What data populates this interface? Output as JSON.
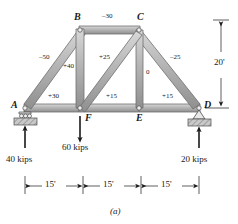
{
  "figure": {
    "caption": "(a)",
    "joints": [
      {
        "id": "A",
        "label": "A"
      },
      {
        "id": "B",
        "label": "B"
      },
      {
        "id": "C",
        "label": "C"
      },
      {
        "id": "D",
        "label": "D"
      },
      {
        "id": "E",
        "label": "E"
      },
      {
        "id": "F",
        "label": "F"
      }
    ],
    "member_forces": [
      {
        "member": "BC",
        "label": "–30"
      },
      {
        "member": "AB",
        "label": "–50"
      },
      {
        "member": "CD",
        "label": "–25"
      },
      {
        "member": "BF",
        "label": "+40"
      },
      {
        "member": "FC",
        "label": "+25"
      },
      {
        "member": "CE",
        "label": "0"
      },
      {
        "member": "AF",
        "label": "+30"
      },
      {
        "member": "FE",
        "label": "+15"
      },
      {
        "member": "ED",
        "label": "+15"
      }
    ],
    "loads": [
      {
        "at": "A",
        "label": "40 kips",
        "direction": "up"
      },
      {
        "at": "F",
        "label": "60 kips",
        "direction": "down"
      },
      {
        "at": "D",
        "label": "20 kips",
        "direction": "up"
      }
    ],
    "dimensions": {
      "horizontal": [
        {
          "label": "15'"
        },
        {
          "label": "15'"
        },
        {
          "label": "15'"
        }
      ],
      "vertical": {
        "label": "20'"
      }
    },
    "supports": [
      {
        "at": "A",
        "type": "roller-support"
      },
      {
        "at": "D",
        "type": "pin-support"
      }
    ],
    "colors": {
      "member_fill": "#b3b3b3",
      "member_edge": "#6e6e6e",
      "ink": "#1a1a1a",
      "hatch": "#9a9a9a"
    }
  }
}
